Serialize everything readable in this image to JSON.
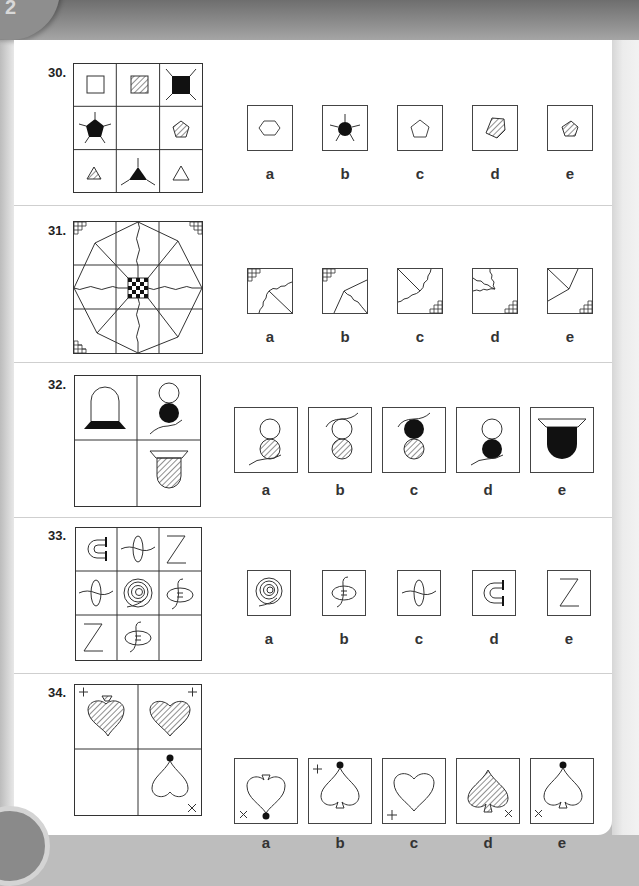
{
  "page": {
    "chapter_tab": "2"
  },
  "questions": [
    {
      "number": "30.",
      "grid": {
        "rows": 3,
        "cols": 3,
        "cells": [
          [
            "square-outline",
            "square-hatched",
            "square-filled-spikes"
          ],
          [
            "pentagon-filled-spikes",
            "blank",
            "pentagon-hatched"
          ],
          [
            "triangle-hatched",
            "triangle-filled-spikes",
            "triangle-outline"
          ]
        ]
      },
      "options": [
        {
          "label": "a",
          "figure": "hexagon-outline"
        },
        {
          "label": "b",
          "figure": "circle-filled-spikes"
        },
        {
          "label": "c",
          "figure": "pentagon-outline"
        },
        {
          "label": "d",
          "figure": "pentagon-hatched-large"
        },
        {
          "label": "e",
          "figure": "pentagon-hatched-small"
        }
      ]
    },
    {
      "number": "31.",
      "grid": {
        "rows": 3,
        "cols": 3,
        "description": "octagon with wavy cross, diagonal spokes, checkered centre square, stepped grid corners at top-left, top-right, bottom-left",
        "missing_cell": "bottom-right"
      },
      "options": [
        {
          "label": "a",
          "figure": "corner-TL, wavy line up-right, straight diagonal to bottom-right"
        },
        {
          "label": "b",
          "figure": "corner-TL, straight lines to bottom and right, wavy to bottom-right"
        },
        {
          "label": "c",
          "figure": "corner-BR, straight diagonal from top-left, wavy lines to left and top"
        },
        {
          "label": "d",
          "figure": "corner-BR, wavy lines in top-left region"
        },
        {
          "label": "e",
          "figure": "corner-BR, straight lines from top-left, top and left"
        }
      ]
    },
    {
      "number": "32.",
      "grid": {
        "rows": 2,
        "cols": 2,
        "cells": [
          [
            "dome-on-filled-base",
            "two-circles-filled-bottom-with-string"
          ],
          [
            "blank",
            "hatched-cup-with-rim"
          ]
        ]
      },
      "options": [
        {
          "label": "a",
          "figure": "two-circles-hatched-bottom-string-bottom"
        },
        {
          "label": "b",
          "figure": "two-circles-hatched-bottom-string-top"
        },
        {
          "label": "c",
          "figure": "filled-top-hatched-bottom-string-top"
        },
        {
          "label": "d",
          "figure": "two-circles-filled-bottom-string-bottom"
        },
        {
          "label": "e",
          "figure": "filled-cup-with-rim"
        }
      ]
    },
    {
      "number": "33.",
      "grid": {
        "rows": 3,
        "cols": 3,
        "cells": [
          [
            "C-arrow",
            "ellipse-wave",
            "Z"
          ],
          [
            "ellipse-wave",
            "spiral",
            "S-ellipse"
          ],
          [
            "Z",
            "S-ellipse",
            "blank"
          ]
        ]
      },
      "options": [
        {
          "label": "a",
          "figure": "spiral"
        },
        {
          "label": "b",
          "figure": "S-ellipse"
        },
        {
          "label": "c",
          "figure": "ellipse-wave"
        },
        {
          "label": "d",
          "figure": "C-arrow"
        },
        {
          "label": "e",
          "figure": "Z"
        }
      ]
    },
    {
      "number": "34.",
      "grid": {
        "rows": 2,
        "cols": 2,
        "cells": [
          [
            "hatched-inverted-spade with plus top-left",
            "hatched-heart with plus top-right"
          ],
          [
            "blank",
            "inverted-heart with dot top and cross bottom-right"
          ]
        ]
      },
      "options": [
        {
          "label": "a",
          "figure": "inverted-spade, dot bottom, cross bottom-left"
        },
        {
          "label": "b",
          "figure": "spade, dot top, plus top-left"
        },
        {
          "label": "c",
          "figure": "heart, plus bottom-left"
        },
        {
          "label": "d",
          "figure": "hatched-spade, cross bottom-right"
        },
        {
          "label": "e",
          "figure": "spade, dot top, cross bottom-left"
        }
      ]
    }
  ]
}
